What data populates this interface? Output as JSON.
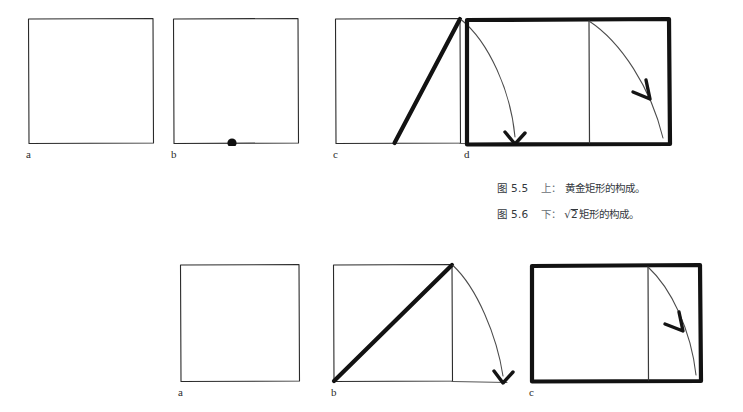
{
  "figure": {
    "background_color": "#ffffff",
    "ink_color": "#1a1a1a",
    "stipple_color": "#4a4a4a",
    "caption_color": "#33383d"
  },
  "captions": [
    {
      "number": "图 5.5",
      "position_word": "上：",
      "text": "黄金矩形的构成。",
      "has_radical": false
    },
    {
      "number": "图 5.6",
      "position_word": "下：",
      "radical_symbol": "√",
      "radicand": "2",
      "text": "矩形的构成。",
      "has_radical": true
    }
  ],
  "rows": [
    {
      "name": "golden-rectangle-construction",
      "panels": [
        {
          "label": "a",
          "description": "stippled-square"
        },
        {
          "label": "b",
          "description": "stippled-square-with-midpoint-dot"
        },
        {
          "label": "c",
          "description": "square-with-diagonal-and-arc-arrow"
        },
        {
          "label": "d",
          "description": "completed-golden-rectangle-with-arc"
        }
      ]
    },
    {
      "name": "root-two-rectangle-construction",
      "panels": [
        {
          "label": "a",
          "description": "stippled-square"
        },
        {
          "label": "b",
          "description": "square-with-corner-diagonal-and-arc-arrow"
        },
        {
          "label": "c",
          "description": "completed-root-two-rectangle-with-arc"
        }
      ]
    }
  ]
}
